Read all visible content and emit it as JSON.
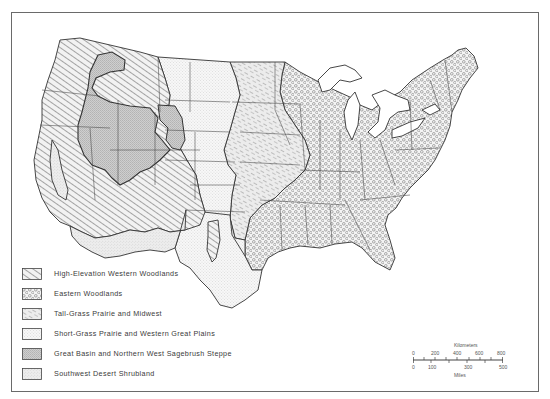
{
  "legend": {
    "items": [
      {
        "label": "High-Elevation Western Woodlands",
        "pattern": "hatch-wide"
      },
      {
        "label": "Eastern Woodlands",
        "pattern": "curly"
      },
      {
        "label": "Tall-Grass Prairie and Midwest",
        "pattern": "hatch-sketch"
      },
      {
        "label": "Short-Grass Prairie and Western Great Plains",
        "pattern": "dots-light"
      },
      {
        "label": "Great Basin and Northern West Sagebrush Steppe",
        "pattern": "dots-dense"
      },
      {
        "label": "Southwest Desert Shrubland",
        "pattern": "stipple"
      }
    ]
  },
  "scale_bar": {
    "kilometers_label": "Kilometers",
    "miles_label": "Miles",
    "km_ticks": [
      "0",
      "200",
      "400",
      "600",
      "800"
    ],
    "mile_ticks": [
      "0",
      "100",
      "300",
      "500"
    ]
  },
  "colors": {
    "ink": "#3a3a3a",
    "frame": "#6a6a6a",
    "background": "#ffffff"
  }
}
